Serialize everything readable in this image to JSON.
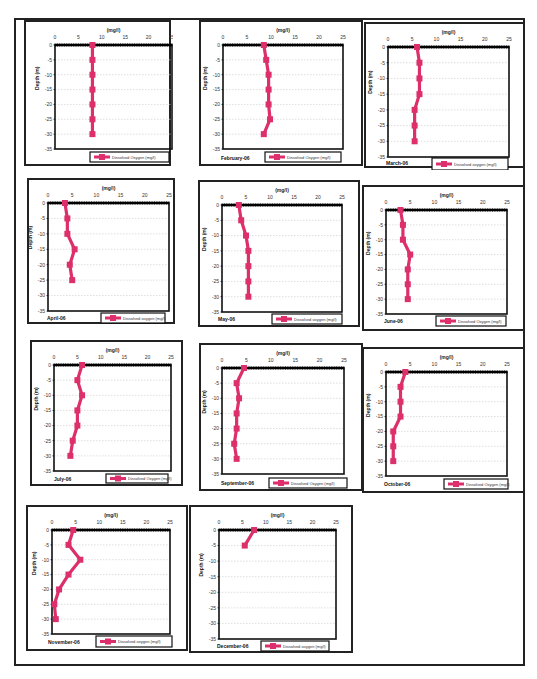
{
  "style": {
    "series_color": "#dc2f6b",
    "axis_color": "#111111",
    "grid_color": "#c8c8c8"
  },
  "chart_data": [
    {
      "type": "line",
      "title": "",
      "month_label": "",
      "xlabel": "(mg/l)",
      "ylabel": "Depth (m)",
      "legend": [
        "Dissolved Oxygen (mg/l)"
      ],
      "legend_position": "bottom-right",
      "xlim": [
        0,
        25
      ],
      "ylim": [
        -35,
        0
      ],
      "xticks": [
        0,
        5,
        10,
        15,
        20,
        25
      ],
      "yticks": [
        0,
        -5,
        -10,
        -15,
        -20,
        -25,
        -30,
        -35
      ],
      "grid": true,
      "series": [
        {
          "name": "Dissolved Oxygen (mg/l)",
          "x": [
            8,
            8,
            8,
            8,
            8,
            8,
            8
          ],
          "y": [
            0,
            -5,
            -10,
            -15,
            -20,
            -25,
            -30
          ]
        }
      ]
    },
    {
      "type": "line",
      "month_label": "February-06",
      "xlabel": "(mg/l)",
      "ylabel": "Depth (m)",
      "legend": [
        "Dissolved Oxygen (mg/l)"
      ],
      "legend_position": "bottom-right",
      "xlim": [
        0,
        25
      ],
      "ylim": [
        -35,
        0
      ],
      "xticks": [
        0,
        5,
        10,
        15,
        20,
        25
      ],
      "yticks": [
        0,
        -5,
        -10,
        -15,
        -20,
        -25,
        -30,
        -35
      ],
      "grid": true,
      "series": [
        {
          "name": "Dissolved Oxygen (mg/l)",
          "x": [
            8.5,
            9,
            9.5,
            9.5,
            9.5,
            9.8,
            8.5
          ],
          "y": [
            0,
            -5,
            -10,
            -15,
            -20,
            -25,
            -30
          ]
        }
      ]
    },
    {
      "type": "line",
      "month_label": "March-06",
      "xlabel": "(mg/l)",
      "ylabel": "Depth (m)",
      "legend": [
        "Dissolved oxygen (mg/l)"
      ],
      "legend_position": "bottom-right",
      "xlim": [
        0,
        25
      ],
      "ylim": [
        -35,
        0
      ],
      "xticks": [
        0,
        5,
        10,
        15,
        20,
        25
      ],
      "yticks": [
        0,
        -5,
        -10,
        -15,
        -20,
        -25,
        -30,
        -35
      ],
      "grid": true,
      "series": [
        {
          "name": "Dissolved oxygen (mg/l)",
          "x": [
            6,
            6.5,
            6.5,
            6.5,
            5.5,
            5.5,
            5.5
          ],
          "y": [
            0,
            -5,
            -10,
            -15,
            -20,
            -25,
            -30
          ]
        }
      ]
    },
    {
      "type": "line",
      "month_label": "April-06",
      "xlabel": "(mg/l)",
      "ylabel": "Depth (m)",
      "legend": [
        "Dissolved oxygen (mg/l)"
      ],
      "legend_position": "bottom-right",
      "xlim": [
        0,
        25
      ],
      "ylim": [
        -35,
        0
      ],
      "xticks": [
        0,
        5,
        10,
        15,
        20,
        25
      ],
      "yticks": [
        0,
        -5,
        -10,
        -15,
        -20,
        -25,
        -30,
        -35
      ],
      "grid": true,
      "series": [
        {
          "name": "Dissolved oxygen (mg/l)",
          "x": [
            3.5,
            4,
            4,
            5.5,
            4.5,
            5
          ],
          "y": [
            0,
            -5,
            -10,
            -15,
            -20,
            -25
          ]
        }
      ]
    },
    {
      "type": "line",
      "month_label": "May-06",
      "xlabel": "(mg/l)",
      "ylabel": "Depth (m)",
      "legend": [
        "Dissolved oxygen (mg/l)"
      ],
      "legend_position": "bottom-right",
      "xlim": [
        0,
        25
      ],
      "ylim": [
        -35,
        0
      ],
      "xticks": [
        0,
        5,
        10,
        15,
        20,
        25
      ],
      "yticks": [
        0,
        -5,
        -10,
        -15,
        -20,
        -25,
        -30,
        -35
      ],
      "grid": true,
      "series": [
        {
          "name": "Dissolved oxygen (mg/l)",
          "x": [
            3.5,
            4,
            5,
            5.5,
            5.5,
            5.5,
            5.5
          ],
          "y": [
            0,
            -5,
            -10,
            -15,
            -20,
            -25,
            -30
          ]
        }
      ]
    },
    {
      "type": "line",
      "month_label": "June-06",
      "xlabel": "(mg/l)",
      "ylabel": "Depth (m)",
      "legend": [
        "Dissolved Oxygen (mg/l)"
      ],
      "legend_position": "bottom-right",
      "xlim": [
        0,
        25
      ],
      "ylim": [
        -35,
        0
      ],
      "xticks": [
        0,
        5,
        10,
        15,
        20,
        25
      ],
      "yticks": [
        0,
        -5,
        -10,
        -15,
        -20,
        -25,
        -30,
        -35
      ],
      "grid": true,
      "series": [
        {
          "name": "Dissolved Oxygen (mg/l)",
          "x": [
            3,
            3.5,
            3.5,
            5,
            4.5,
            4.5,
            4.5
          ],
          "y": [
            0,
            -5,
            -10,
            -15,
            -20,
            -25,
            -30
          ]
        }
      ]
    },
    {
      "type": "line",
      "month_label": "July-06",
      "xlabel": "(mg/l)",
      "ylabel": "Depth (m)",
      "legend": [
        "Dissolved Oxygen (mg/l)"
      ],
      "legend_position": "bottom-right",
      "xlim": [
        0,
        25
      ],
      "ylim": [
        -35,
        0
      ],
      "xticks": [
        0,
        5,
        10,
        15,
        20,
        25
      ],
      "yticks": [
        0,
        -5,
        -10,
        -15,
        -20,
        -25,
        -30,
        -35
      ],
      "grid": true,
      "series": [
        {
          "name": "Dissolved Oxygen (mg/l)",
          "x": [
            6,
            5,
            6,
            5,
            5,
            4,
            3.5
          ],
          "y": [
            0,
            -5,
            -10,
            -15,
            -20,
            -25,
            -30
          ]
        }
      ]
    },
    {
      "type": "line",
      "month_label": "September-06",
      "xlabel": "(mg/l)",
      "ylabel": "Depth (m)",
      "legend": [
        "Dissolved Oxygen (mg/l)"
      ],
      "legend_position": "bottom-right",
      "xlim": [
        0,
        25
      ],
      "ylim": [
        -35,
        0
      ],
      "xticks": [
        0,
        5,
        10,
        15,
        20,
        25
      ],
      "yticks": [
        0,
        -5,
        -10,
        -15,
        -20,
        -25,
        -30,
        -35
      ],
      "grid": true,
      "series": [
        {
          "name": "Dissolved Oxygen (mg/l)",
          "x": [
            4.5,
            3,
            3.5,
            3,
            3,
            2.5,
            3
          ],
          "y": [
            0,
            -5,
            -10,
            -15,
            -20,
            -25,
            -30
          ]
        }
      ]
    },
    {
      "type": "line",
      "month_label": "October-06",
      "xlabel": "(mg/l)",
      "ylabel": "Depth (m)",
      "legend": [
        "Dissolved Oxygen (mg/l)"
      ],
      "legend_position": "bottom-right",
      "xlim": [
        0,
        25
      ],
      "ylim": [
        -35,
        0
      ],
      "xticks": [
        0,
        5,
        10,
        15,
        20,
        25
      ],
      "yticks": [
        0,
        -5,
        -10,
        -15,
        -20,
        -25,
        -30,
        -35
      ],
      "grid": true,
      "series": [
        {
          "name": "Dissolved Oxygen (mg/l)",
          "x": [
            4,
            3,
            3,
            3,
            1.5,
            1.5,
            1.5
          ],
          "y": [
            0,
            -5,
            -10,
            -15,
            -20,
            -25,
            -30
          ]
        }
      ]
    },
    {
      "type": "line",
      "month_label": "November-06",
      "xlabel": "(mg/l)",
      "ylabel": "Depth (m)",
      "legend": [
        "Dissolved oxygen (mg/l)"
      ],
      "legend_position": "bottom-right",
      "xlim": [
        0,
        25
      ],
      "ylim": [
        -35,
        0
      ],
      "xticks": [
        0,
        5,
        10,
        15,
        20,
        25
      ],
      "yticks": [
        0,
        -5,
        -10,
        -15,
        -20,
        -25,
        -30,
        -35
      ],
      "grid": true,
      "series": [
        {
          "name": "Dissolved oxygen (mg/l)",
          "x": [
            4.5,
            3.5,
            6,
            3.5,
            1.5,
            0.5,
            0.8
          ],
          "y": [
            0,
            -5,
            -10,
            -15,
            -20,
            -25,
            -30
          ]
        }
      ]
    },
    {
      "type": "line",
      "month_label": "December-06",
      "xlabel": "(mg/l)",
      "ylabel": "Depth (m)",
      "legend": [
        "Dissolved oxygen (mg/l)"
      ],
      "legend_position": "bottom-right",
      "xlim": [
        0,
        25
      ],
      "ylim": [
        -35,
        0
      ],
      "xticks": [
        0,
        5,
        10,
        15,
        20,
        25
      ],
      "yticks": [
        0,
        -5,
        -10,
        -15,
        -20,
        -25,
        -30,
        -35
      ],
      "grid": true,
      "series": [
        {
          "name": "Dissolved oxygen (mg/l)",
          "x": [
            7.5,
            5.5
          ],
          "y": [
            0,
            -5
          ]
        }
      ]
    }
  ],
  "layout": [
    {
      "left": 24,
      "top": 20,
      "w": 147,
      "h": 146,
      "plot": [
        29,
        23,
        117,
        104
      ],
      "legend": [
        64,
        130,
        79,
        10
      ],
      "month_pos": null,
      "ylabel": false
    },
    {
      "left": 199,
      "top": 20,
      "w": 164,
      "h": 146,
      "plot": [
        22,
        23,
        120,
        104
      ],
      "legend": [
        64,
        130,
        76,
        10
      ],
      "month_pos": [
        20,
        138
      ],
      "ylabel": true
    },
    {
      "left": 364,
      "top": 22,
      "w": 161,
      "h": 146,
      "plot": [
        22,
        23,
        121,
        110
      ],
      "legend": [
        66,
        134,
        76,
        12
      ],
      "month_pos": [
        20,
        141
      ],
      "ylabel": true
    },
    {
      "left": 27,
      "top": 178,
      "w": 148,
      "h": 146,
      "plot": [
        19,
        23,
        121,
        108
      ],
      "legend": [
        72,
        133,
        64,
        10
      ],
      "month_pos": [
        18,
        140
      ],
      "ylabel": true
    },
    {
      "left": 198,
      "top": 180,
      "w": 162,
      "h": 147,
      "plot": [
        22,
        23,
        120,
        107
      ],
      "legend": [
        72,
        132,
        70,
        10
      ],
      "month_pos": [
        18,
        139
      ],
      "ylabel": true
    },
    {
      "left": 362,
      "top": 185,
      "w": 163,
      "h": 146,
      "plot": [
        22,
        23,
        121,
        104
      ],
      "legend": [
        72,
        129,
        70,
        10
      ],
      "month_pos": [
        20,
        136
      ],
      "ylabel": true
    },
    {
      "left": 30,
      "top": 340,
      "w": 153,
      "h": 146,
      "plot": [
        22,
        23,
        117,
        106
      ],
      "legend": [
        74,
        132,
        62,
        9
      ],
      "month_pos": [
        22,
        139
      ],
      "ylabel": true
    },
    {
      "left": 199,
      "top": 343,
      "w": 164,
      "h": 148,
      "plot": [
        21,
        23,
        122,
        106
      ],
      "legend": [
        68,
        133,
        78,
        10
      ],
      "month_pos": [
        20,
        140
      ],
      "ylabel": true
    },
    {
      "left": 362,
      "top": 347,
      "w": 163,
      "h": 146,
      "plot": [
        22,
        23,
        121,
        104
      ],
      "legend": [
        80,
        130,
        64,
        10
      ],
      "month_pos": [
        20,
        137
      ],
      "ylabel": true
    },
    {
      "left": 26,
      "top": 505,
      "w": 162,
      "h": 146,
      "plot": [
        24,
        23,
        118,
        104
      ],
      "legend": [
        68,
        129,
        76,
        11
      ],
      "month_pos": [
        20,
        137
      ],
      "ylabel": true
    },
    {
      "left": 189,
      "top": 505,
      "w": 164,
      "h": 148,
      "plot": [
        28,
        23,
        117,
        109
      ],
      "legend": [
        70,
        134,
        68,
        10
      ],
      "month_pos": [
        26,
        141
      ],
      "ylabel": true
    }
  ]
}
